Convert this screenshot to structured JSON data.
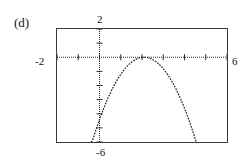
{
  "figure": {
    "part_label": "(d)",
    "caption": ""
  },
  "axis_labels": {
    "y_max": "2",
    "x_min": "-2",
    "x_max": "6",
    "y_min": "-6"
  },
  "colors": {
    "ink": "#141414",
    "frame": "#3b3b3b",
    "curve": "#1f1f1f",
    "axis": "#2b2b2b",
    "background": "#ffffff"
  },
  "chart_data": {
    "type": "line",
    "title": "(d)",
    "xlabel": "",
    "ylabel": "",
    "xlim": [
      -2,
      6
    ],
    "ylim": [
      -6,
      2
    ],
    "grid": false,
    "legend": null,
    "axis_style": "dotted-with-tick-marks",
    "x_tick_step": 1,
    "y_tick_step": 1,
    "annotations": [
      {
        "text": "2",
        "position": "above-y-axis",
        "value": 2
      },
      {
        "text": "-2",
        "position": "left-of-x-axis",
        "value": -2
      },
      {
        "text": "6",
        "position": "right-of-x-axis",
        "value": 6
      },
      {
        "text": "-6",
        "position": "below-y-axis",
        "value": -6
      }
    ],
    "series": [
      {
        "name": "downward parabola tangent to x-axis",
        "equation": "y = -(x - 2.1)^2",
        "vertex": [
          2.1,
          0
        ],
        "x": [
          0.55,
          0.8,
          1.05,
          1.3,
          1.55,
          1.8,
          2.1,
          2.4,
          2.65,
          2.9,
          3.15,
          3.4,
          3.65,
          3.9,
          4.15,
          4.4,
          4.65,
          4.9,
          5.15,
          5.4,
          5.65,
          5.9
        ],
        "y": [
          -2.4,
          -1.69,
          -1.1,
          -0.64,
          -0.3,
          -0.09,
          0,
          -0.09,
          -0.3,
          -0.64,
          -1.1,
          -1.69,
          -2.4,
          -3.24,
          -4.2,
          -5.29,
          -6.5,
          -7.84,
          -9.3,
          -10.89,
          -12.6,
          -14.44
        ]
      }
    ]
  }
}
